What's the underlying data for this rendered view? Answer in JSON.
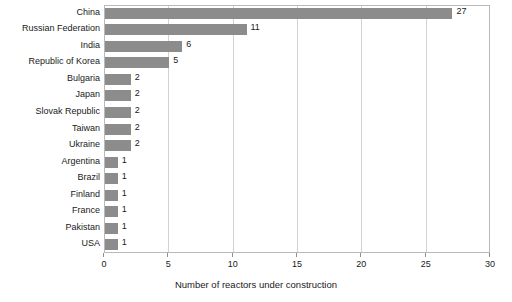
{
  "chart_data": {
    "type": "bar",
    "orientation": "horizontal",
    "title": "",
    "xlabel": "Number of reactors under construction",
    "ylabel": "",
    "xlim": [
      0,
      30
    ],
    "xticks": [
      0,
      5,
      10,
      15,
      20,
      25,
      30
    ],
    "grid": true,
    "legend": null,
    "bar_color": "#8c8c8c",
    "categories": [
      "China",
      "Russian Federation",
      "India",
      "Republic of Korea",
      "Bulgaria",
      "Japan",
      "Slovak Republic",
      "Taiwan",
      "Ukraine",
      "Argentina",
      "Brazil",
      "Finland",
      "France",
      "Pakistan",
      "USA"
    ],
    "values": [
      27,
      11,
      6,
      5,
      2,
      2,
      2,
      2,
      2,
      1,
      1,
      1,
      1,
      1,
      1
    ],
    "value_labels": [
      "27",
      "11",
      "6",
      "5",
      "2",
      "2",
      "2",
      "2",
      "2",
      "1",
      "1",
      "1",
      "1",
      "1",
      "1"
    ],
    "xtick_labels": [
      "0",
      "5",
      "10",
      "15",
      "20",
      "25",
      "30"
    ]
  }
}
